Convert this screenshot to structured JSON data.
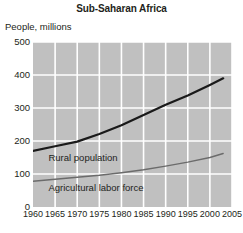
{
  "chart_data": {
    "type": "line",
    "title": "Sub-Saharan Africa",
    "ylabel": "People, millions",
    "xlabel": "",
    "ylim": [
      0,
      500
    ],
    "xlim": [
      1960,
      2005
    ],
    "yticks": [
      0,
      100,
      200,
      300,
      400,
      500
    ],
    "xticks": [
      1960,
      1965,
      1970,
      1975,
      1980,
      1985,
      1990,
      1995,
      2000,
      2005
    ],
    "grid": true,
    "legend_position": "inline-labels",
    "x": [
      1960,
      1965,
      1970,
      1975,
      1980,
      1985,
      1990,
      1995,
      2000,
      2003
    ],
    "series": [
      {
        "name": "Rural population",
        "color": "#1a1a1a",
        "width": 2.2,
        "values": [
          170,
          184,
          198,
          221,
          248,
          279,
          310,
          338,
          370,
          390
        ]
      },
      {
        "name": "Agricultural labor force",
        "color": "#6b6b6b",
        "width": 1.4,
        "values": [
          78,
          84,
          90,
          96,
          104,
          113,
          124,
          136,
          150,
          162
        ]
      }
    ],
    "annotations": [
      {
        "text": "Rural population",
        "x": 1963.5,
        "y": 150
      },
      {
        "text": "Agricultural labor force",
        "x": 1963.5,
        "y": 58
      }
    ],
    "colors": {
      "plot_background": "#c0c0c0",
      "gridline": "#ffffff",
      "page_background": "#ffffff",
      "text": "#231f20"
    }
  }
}
